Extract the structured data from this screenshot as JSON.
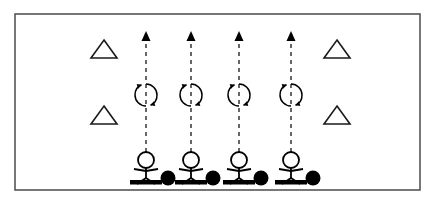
{
  "diagram": {
    "background_color": "#ffffff",
    "ink_color": "#000000",
    "rink": {
      "label": "rink-boundary",
      "border_color": "#555555",
      "fill_color": "#ffffff",
      "x": 15,
      "y": 14,
      "width": 405,
      "height": 176,
      "border_width": 1.5
    },
    "cones": [
      {
        "label": "cone-upper-left",
        "x": 104,
        "y": 52,
        "size": 26,
        "style": "outline"
      },
      {
        "label": "cone-lower-left",
        "x": 104,
        "y": 118,
        "size": 26,
        "style": "outline"
      },
      {
        "label": "cone-upper-right",
        "x": 337,
        "y": 52,
        "size": 26,
        "style": "outline"
      },
      {
        "label": "cone-lower-right",
        "x": 337,
        "y": 118,
        "size": 26,
        "style": "outline"
      }
    ],
    "lanes": [
      {
        "label": "lane-1",
        "x": 146,
        "arrow_top_y": 33,
        "arrow_bottom_y": 152,
        "spin_y": 95,
        "spin_radius": 11,
        "dash": "4,4"
      },
      {
        "label": "lane-2",
        "x": 191,
        "arrow_top_y": 33,
        "arrow_bottom_y": 152,
        "spin_y": 95,
        "spin_radius": 11,
        "dash": "4,4"
      },
      {
        "label": "lane-3",
        "x": 239,
        "arrow_top_y": 33,
        "arrow_bottom_y": 152,
        "spin_y": 95,
        "spin_radius": 11,
        "dash": "4,4"
      },
      {
        "label": "lane-4",
        "x": 291,
        "arrow_top_y": 33,
        "arrow_bottom_y": 152,
        "spin_y": 95,
        "spin_radius": 11,
        "dash": "4,4"
      }
    ],
    "players": [
      {
        "label": "player-1",
        "x": 146,
        "y": 158,
        "puck_offset_x": 22,
        "stick_color": "#000000",
        "puck_color": "#000000"
      },
      {
        "label": "player-2",
        "x": 191,
        "y": 158,
        "puck_offset_x": 22,
        "stick_color": "#000000",
        "puck_color": "#000000"
      },
      {
        "label": "player-3",
        "x": 239,
        "y": 158,
        "puck_offset_x": 22,
        "stick_color": "#000000",
        "puck_color": "#000000"
      },
      {
        "label": "player-4",
        "x": 291,
        "y": 158,
        "puck_offset_x": 22,
        "stick_color": "#000000",
        "puck_color": "#000000"
      }
    ],
    "counts": {
      "cones": 4,
      "lanes": 4,
      "players": 4,
      "spin_symbols": 4
    }
  }
}
